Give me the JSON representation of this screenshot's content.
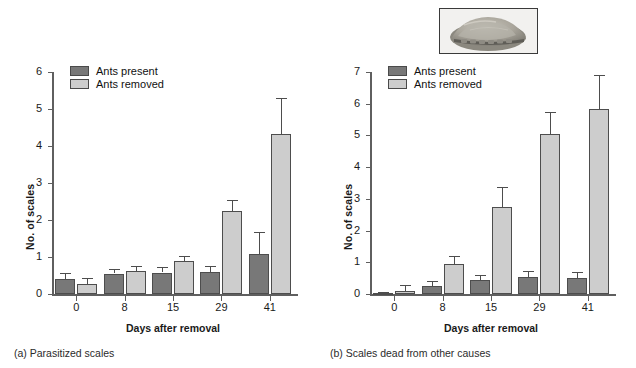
{
  "figure": {
    "inset_icon": "scale-insect-photo",
    "inset_alt": "Photograph of a scale insect"
  },
  "legend": {
    "series": [
      {
        "label": "Ants present",
        "color": "#787878"
      },
      {
        "label": "Ants removed",
        "color": "#cdcdcd"
      }
    ]
  },
  "captions": {
    "a": "(a) Parasitized scales",
    "b": "(b) Scales dead from other causes"
  },
  "chart_data": [
    {
      "id": "a",
      "type": "bar",
      "title": "",
      "caption": "(a) Parasitized scales",
      "xlabel": "Days after removal",
      "ylabel": "No. of scales",
      "categories": [
        "0",
        "8",
        "15",
        "29",
        "41"
      ],
      "ylim": [
        0,
        6
      ],
      "yticks": [
        0,
        1,
        2,
        3,
        4,
        5,
        6
      ],
      "grid": false,
      "legend_position": "top-left",
      "series": [
        {
          "name": "Ants present",
          "color": "#787878",
          "values": [
            0.4,
            0.55,
            0.58,
            0.59,
            1.07
          ],
          "errors_upper": [
            0.18,
            0.12,
            0.14,
            0.16,
            0.6
          ]
        },
        {
          "name": "Ants removed",
          "color": "#cdcdcd",
          "values": [
            0.28,
            0.62,
            0.89,
            2.24,
            4.33
          ],
          "errors_upper": [
            0.15,
            0.14,
            0.15,
            0.3,
            0.96
          ]
        }
      ]
    },
    {
      "id": "b",
      "type": "bar",
      "title": "",
      "caption": "(b) Scales dead from other causes",
      "xlabel": "Days after removal",
      "ylabel": "No. of scales",
      "categories": [
        "0",
        "8",
        "15",
        "29",
        "41"
      ],
      "ylim": [
        0,
        7
      ],
      "yticks": [
        0,
        1,
        2,
        3,
        4,
        5,
        6,
        7
      ],
      "grid": false,
      "legend_position": "top-left",
      "series": [
        {
          "name": "Ants present",
          "color": "#787878",
          "values": [
            0.03,
            0.25,
            0.44,
            0.53,
            0.49
          ],
          "errors_upper": [
            0.02,
            0.16,
            0.16,
            0.2,
            0.19
          ]
        },
        {
          "name": "Ants removed",
          "color": "#cdcdcd",
          "values": [
            0.08,
            0.95,
            2.74,
            5.04,
            5.82
          ],
          "errors_upper": [
            0.19,
            0.25,
            0.63,
            0.7,
            1.1
          ]
        }
      ]
    }
  ]
}
